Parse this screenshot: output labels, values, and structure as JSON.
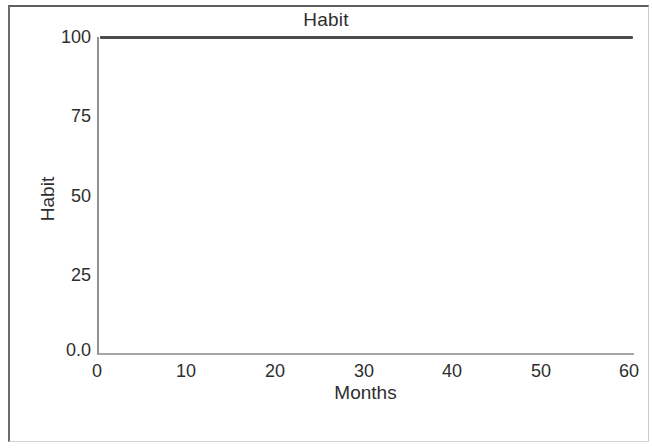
{
  "figure": {
    "title": "Habit",
    "border_color": "#5b5e62",
    "background": "#ffffff"
  },
  "chart_data": {
    "type": "line",
    "title": "Habit",
    "xlabel": "Months",
    "ylabel": "Habit",
    "xlim": [
      0,
      60
    ],
    "ylim": [
      0.0,
      100
    ],
    "xticks": [
      "0",
      "10",
      "20",
      "30",
      "40",
      "50",
      "60"
    ],
    "xtick_values": [
      0,
      10,
      20,
      30,
      40,
      50,
      60
    ],
    "yticks": [
      "0.0",
      "25",
      "50",
      "75",
      "100"
    ],
    "ytick_values": [
      0.0,
      25,
      50,
      75,
      100
    ],
    "grid": false,
    "legend": null,
    "series": [
      {
        "name": "Habit",
        "color": "#4a4d50",
        "line_width": 3,
        "x": [
          0,
          10,
          20,
          30,
          40,
          50,
          60
        ],
        "values": [
          100,
          100,
          100,
          100,
          100,
          100,
          100
        ]
      }
    ],
    "annotations": []
  },
  "axes": {
    "y_axis_color": "#8e9194",
    "x_axis_color": "#a4a7aa"
  }
}
